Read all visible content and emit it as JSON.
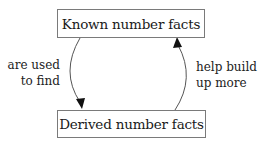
{
  "diagram": {
    "nodes": [
      {
        "id": "known",
        "label": "Known number facts"
      },
      {
        "id": "derived",
        "label": "Derived number facts"
      }
    ],
    "edges": [
      {
        "from": "known",
        "to": "derived",
        "label_lines": [
          "are used",
          "to find"
        ],
        "side": "left"
      },
      {
        "from": "derived",
        "to": "known",
        "label_lines": [
          "help build",
          "up more"
        ],
        "side": "right"
      }
    ],
    "colors": {
      "stroke": "#555555",
      "box_border": "#7a7a7a",
      "text": "#1a1a1a",
      "background": "#ffffff"
    }
  }
}
